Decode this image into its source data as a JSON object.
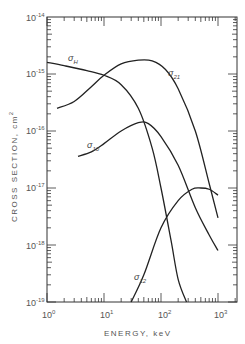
{
  "chart_data": {
    "type": "line",
    "title": "",
    "xlabel": "ENERGY, keV",
    "ylabel": "CROSS SECTION, cm²",
    "xscale": "log",
    "yscale": "log",
    "xlim": [
      1,
      2000
    ],
    "ylim": [
      1e-19,
      1e-14
    ],
    "grid": false,
    "legend": "inline curve labels",
    "x_tick_labels": [
      "10^0",
      "10^1",
      "10^2",
      "10^3"
    ],
    "y_tick_labels": [
      "10^-14",
      "10^-15",
      "10^-16",
      "10^-17",
      "10^-18",
      "10^-19"
    ],
    "series": [
      {
        "name": "σH",
        "label_base": "σ",
        "label_sub": "H",
        "x": [
          1,
          2,
          5,
          10,
          20,
          40,
          70,
          100,
          150,
          200,
          280
        ],
        "y": [
          1.6e-15,
          1.4e-15,
          1.15e-15,
          9.5e-16,
          6.5e-16,
          2.5e-16,
          5e-17,
          1e-17,
          1.2e-18,
          2.5e-19,
          1e-19
        ]
      },
      {
        "name": "σ21",
        "label_base": "σ",
        "label_sub": "21",
        "x": [
          1.5,
          3,
          6,
          10,
          20,
          40,
          70,
          120,
          200,
          400,
          700,
          1000
        ],
        "y": [
          2.5e-16,
          3.3e-16,
          6e-16,
          9.5e-16,
          1.5e-15,
          1.75e-15,
          1.7e-15,
          1.2e-15,
          5.5e-16,
          1e-16,
          1.2e-17,
          3e-18
        ]
      },
      {
        "name": "σ10",
        "label_base": "σ",
        "label_sub": "10",
        "x": [
          3.5,
          6,
          10,
          20,
          40,
          60,
          100,
          200,
          400,
          700,
          1000
        ],
        "y": [
          3.6e-17,
          4.3e-17,
          6e-17,
          1e-16,
          1.4e-16,
          1.35e-16,
          8e-17,
          2.5e-17,
          4.5e-18,
          1.5e-18,
          8e-19
        ]
      },
      {
        "name": "σ12",
        "label_base": "σ",
        "label_sub": "12",
        "x": [
          30,
          50,
          100,
          200,
          350,
          500,
          700,
          1000
        ],
        "y": [
          1e-19,
          3e-19,
          2e-18,
          6e-18,
          9.5e-18,
          1e-17,
          9.5e-18,
          7.5e-18
        ]
      }
    ]
  },
  "axes": {
    "xlabel": "ENERGY, keV",
    "ylabel": "CROSS SECTION, cm",
    "ylabel_sup": "2",
    "x_ticks": [
      {
        "base": "10",
        "exp": "0"
      },
      {
        "base": "10",
        "exp": "1"
      },
      {
        "base": "10",
        "exp": "2"
      },
      {
        "base": "10",
        "exp": "3"
      }
    ],
    "y_ticks": [
      {
        "base": "10",
        "exp": "-14"
      },
      {
        "base": "10",
        "exp": "-15"
      },
      {
        "base": "10",
        "exp": "-16"
      },
      {
        "base": "10",
        "exp": "-17"
      },
      {
        "base": "10",
        "exp": "-18"
      },
      {
        "base": "10",
        "exp": "-19"
      }
    ]
  },
  "labels": {
    "sH": {
      "base": "σ",
      "sub": "H"
    },
    "s21": {
      "base": "σ",
      "sub": "21"
    },
    "s10": {
      "base": "σ",
      "sub": "10"
    },
    "s12": {
      "base": "σ",
      "sub": "12"
    }
  }
}
